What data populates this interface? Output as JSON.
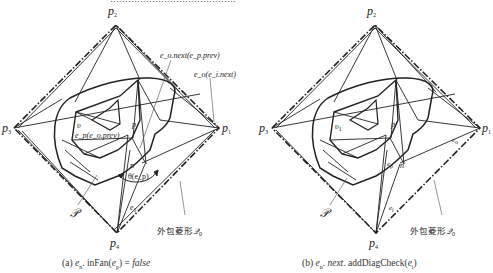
{
  "figure": {
    "cutoff_header": "……………………………………",
    "left": {
      "caption": {
        "prefix": "(a) ",
        "expr": "e",
        "expr_sub": "n",
        "expr_rest": ". inFan(",
        "arg": "e",
        "arg_sub": "p",
        "tail": ") = ",
        "value": "false"
      },
      "labels": {
        "p1": "p",
        "p1_sub": "1",
        "p2": "p",
        "p2_sub": "2",
        "p3": "p",
        "p3_sub": "3",
        "p4": "p",
        "p4_sub": "4",
        "p": "p",
        "n": "n",
        "v": "υ",
        "e1": "e",
        "e1_sub": "1",
        "script_p": "𝒫",
        "ann_top": "e_o.next(e_p.prev)",
        "ann_top_html": "eo.next(ep.prev)",
        "ann_mid": "e_o(e_i.next)",
        "ann_inner": "e_p(e_o.prev)",
        "theta": "θ(e_p)",
        "hull_label": "外包菱形",
        "hull_symbol": "𝒬",
        "hull_sub": "0"
      }
    },
    "right": {
      "caption": {
        "prefix": "(b) ",
        "expr": "e",
        "expr_sub": "n",
        "expr_rest": ". ",
        "next": "next",
        "method": ". addDiagCheck(",
        "arg": "e",
        "arg_sub": "i",
        "tail": ")"
      },
      "labels": {
        "p1": "p",
        "p1_sub": "1",
        "p2": "p",
        "p2_sub": "2",
        "p3": "p",
        "p3_sub": "3",
        "p4": "p",
        "p4_sub": "4",
        "p": "p",
        "n": "n",
        "v1": "υ",
        "v1_sub": "1",
        "ep": "e",
        "ep_sub": "p",
        "eo": "e",
        "eo_sub": "o",
        "ei": "e",
        "ei_sub": "i",
        "script_p": "𝒫",
        "hull_label": "外包菱形",
        "hull_symbol": "𝒬",
        "hull_sub": "0"
      }
    },
    "colors": {
      "stroke": "#222222",
      "arrow": "#666666",
      "background": "#ffffff"
    }
  }
}
